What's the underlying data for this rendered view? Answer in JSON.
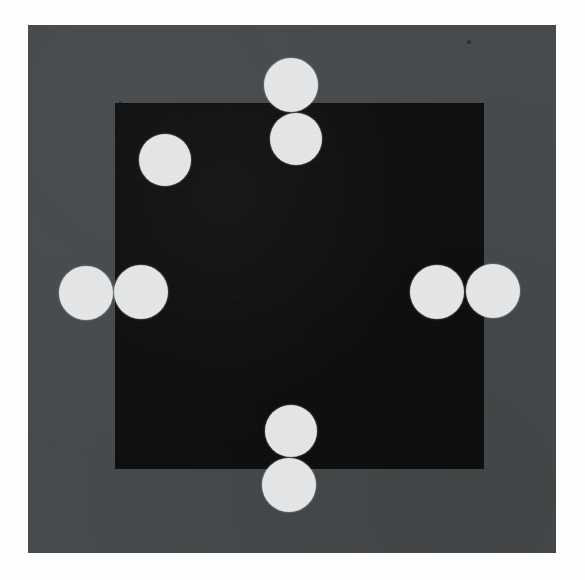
{
  "scene": {
    "title": "Calibration target photograph",
    "description": "Near-black square plate on a dark gray background with eight white circular fiducial markers",
    "canvas": {
      "width": 585,
      "height": 580,
      "background_color": "#fdfdfd"
    },
    "plate": {
      "label": "gray-background-plate",
      "color": "#474a4c",
      "x": 28,
      "y": 25,
      "width": 528,
      "height": 528
    },
    "dark_square": {
      "label": "dark-square-region",
      "color": "#0d0d0d",
      "x": 115,
      "y": 103,
      "width": 341,
      "height": 341
    },
    "marker_color": "#e4e6e8",
    "marker_count": 8
  },
  "markers": [
    {
      "name": "top-outer-marker",
      "group": "top",
      "cx": 291,
      "cy": 85,
      "r": 27
    },
    {
      "name": "top-inner-marker",
      "group": "top",
      "cx": 296,
      "cy": 139,
      "r": 26
    },
    {
      "name": "upper-left-marker",
      "group": "corner",
      "cx": 165,
      "cy": 160,
      "r": 26
    },
    {
      "name": "left-outer-marker",
      "group": "left",
      "cx": 86,
      "cy": 293,
      "r": 27
    },
    {
      "name": "left-inner-marker",
      "group": "left",
      "cx": 141,
      "cy": 292,
      "r": 27
    },
    {
      "name": "right-inner-marker",
      "group": "right",
      "cx": 437,
      "cy": 292,
      "r": 27
    },
    {
      "name": "right-outer-marker",
      "group": "right",
      "cx": 493,
      "cy": 291,
      "r": 27
    },
    {
      "name": "bottom-inner-marker",
      "group": "bottom",
      "cx": 291,
      "cy": 431,
      "r": 26
    },
    {
      "name": "bottom-outer-marker",
      "group": "bottom",
      "cx": 289,
      "cy": 485,
      "r": 27
    }
  ],
  "specks": [
    {
      "name": "dust-speck-upper-right",
      "cx": 469,
      "cy": 42,
      "r": 2
    },
    {
      "name": "dust-speck-mid-left",
      "cx": 120,
      "cy": 102,
      "r": 1.5
    }
  ]
}
